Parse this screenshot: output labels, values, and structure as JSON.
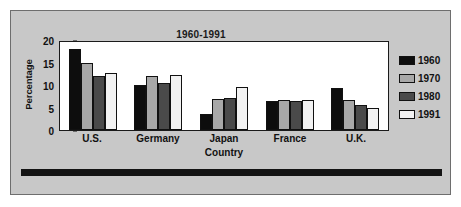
{
  "figure": {
    "background_color": "#c8c8c8",
    "plot_background_color": "#ffffff",
    "border_color": "#6e6e6e"
  },
  "chart_data": {
    "type": "bar",
    "title": "1960-1991",
    "xlabel": "Country",
    "ylabel": "Percentage",
    "categories": [
      "U.S.",
      "Germany",
      "Japan",
      "France",
      "U.K."
    ],
    "series": [
      {
        "name": "1960",
        "color": "#0d0d0d",
        "values": [
          18,
          10,
          3.6,
          6.4,
          9.4
        ]
      },
      {
        "name": "1970",
        "color": "#a8a8a8",
        "values": [
          15,
          12,
          6.8,
          6.7,
          6.6
        ]
      },
      {
        "name": "1980",
        "color": "#4a4a4a",
        "values": [
          12,
          10.5,
          7.2,
          6.4,
          5.5
        ]
      },
      {
        "name": "1991",
        "color": "#f2f2f2",
        "values": [
          12.7,
          12.3,
          9.5,
          6.7,
          4.8
        ]
      }
    ],
    "ylim": [
      0,
      20
    ],
    "yticks": [
      "0",
      "5",
      "10",
      "15",
      "20"
    ],
    "grid": false,
    "legend_position": "right"
  }
}
